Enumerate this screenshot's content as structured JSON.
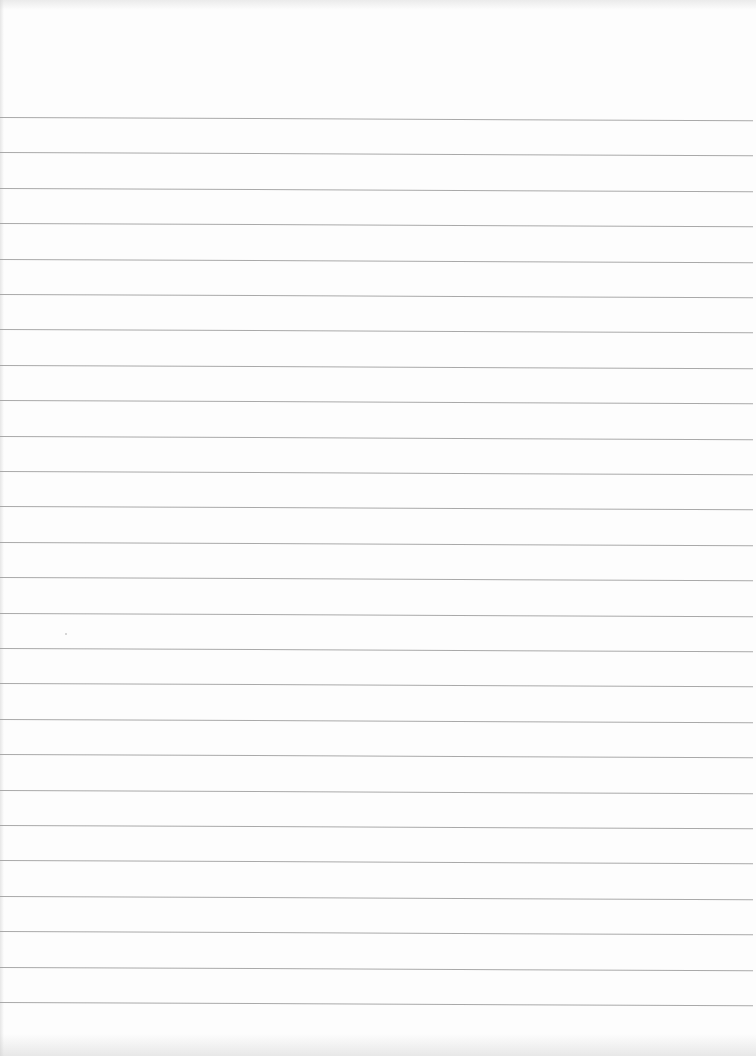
{
  "document": {
    "type": "lined-paper",
    "content_text": "",
    "background_color": "#fdfdfd",
    "rule_color": "#a9a9a9",
    "rule_count": 26,
    "rule_first_y": 117,
    "rule_spacing": 35.4
  }
}
